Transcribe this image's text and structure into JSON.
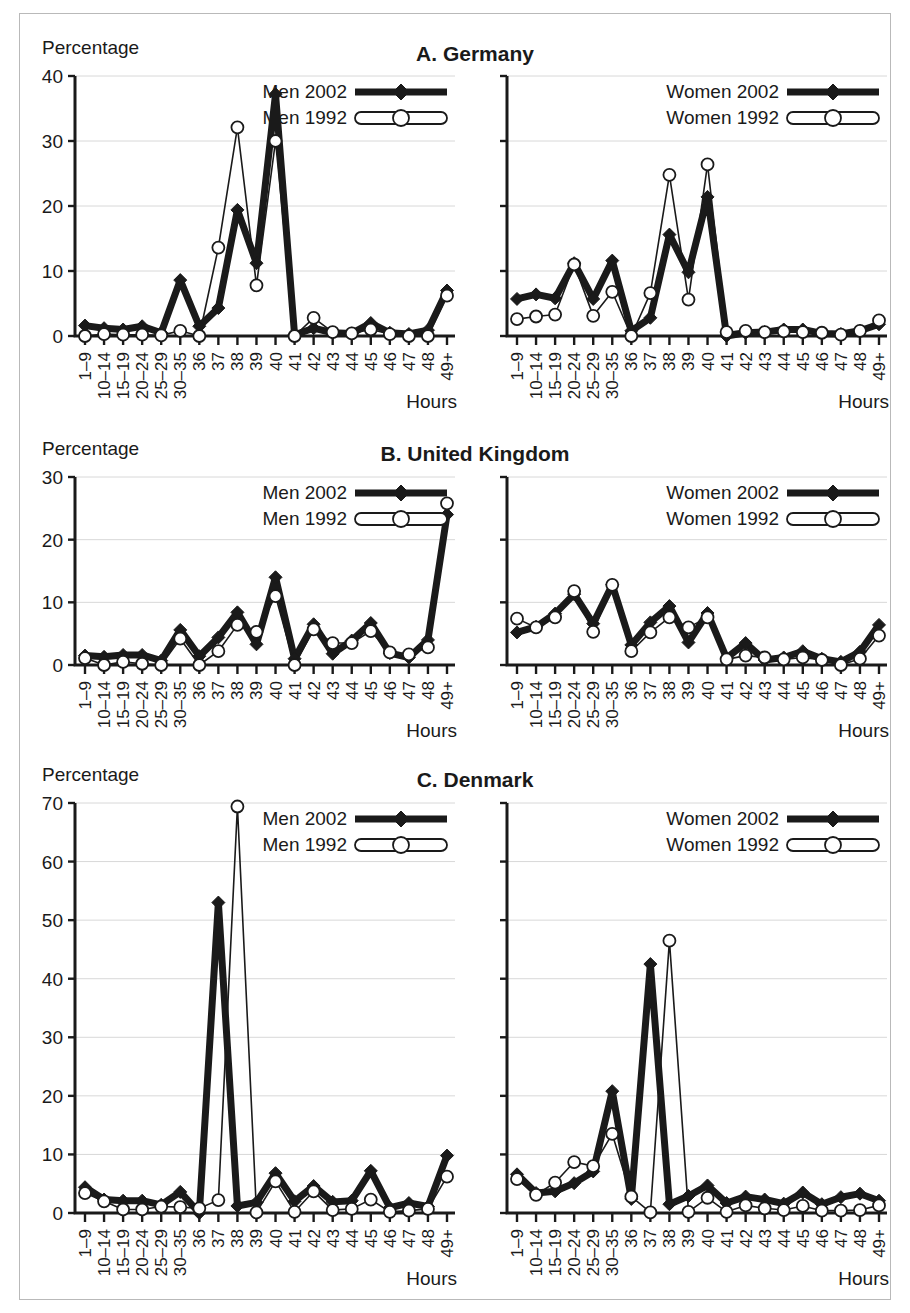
{
  "figure": {
    "y_axis_label": "Percentage",
    "x_axis_label": "Hours",
    "categories": [
      "1–9",
      "10–14",
      "15–19",
      "20–24",
      "25–29",
      "30–35",
      "36",
      "37",
      "38",
      "39",
      "40",
      "41",
      "42",
      "43",
      "44",
      "45",
      "46",
      "47",
      "48",
      "49+"
    ],
    "colors": {
      "ink": "#1a1a1a",
      "grid": "#d8d8d8",
      "frame": "#b9b9b9",
      "marker_fill_open": "#ffffff"
    }
  },
  "chart_data": [
    {
      "type": "line",
      "title": "A. Germany",
      "panel": "left",
      "subject": "men",
      "xlabel": "Hours",
      "ylabel": "Percentage",
      "ylim": [
        0,
        40
      ],
      "yticks": [
        0,
        10,
        20,
        30,
        40
      ],
      "grid": true,
      "legend_position": "top-right",
      "x": [
        "1–9",
        "10–14",
        "15–19",
        "20–24",
        "25–29",
        "30–35",
        "36",
        "37",
        "38",
        "39",
        "40",
        "41",
        "42",
        "43",
        "44",
        "45",
        "46",
        "47",
        "48",
        "49+"
      ],
      "series": [
        {
          "name": "Men 2002",
          "marker": "diamond-filled",
          "style": "thick-solid",
          "values": [
            1.6,
            1.2,
            1.0,
            1.5,
            0.5,
            8.6,
            1.5,
            4.3,
            19.4,
            11.2,
            37.2,
            0.2,
            1.2,
            0.5,
            0.4,
            2.0,
            0.5,
            0.3,
            0.9,
            7.0
          ]
        },
        {
          "name": "Men 1992",
          "marker": "circle-open",
          "style": "thin-open",
          "values": [
            0.0,
            0.3,
            0.2,
            0.2,
            0.1,
            0.8,
            0.0,
            13.6,
            32.1,
            7.8,
            30.0,
            0.0,
            2.8,
            0.6,
            0.4,
            1.0,
            0.3,
            0.0,
            0.0,
            6.2
          ]
        }
      ]
    },
    {
      "type": "line",
      "title": "A. Germany",
      "panel": "right",
      "subject": "women",
      "xlabel": "Hours",
      "ylabel": "Percentage",
      "ylim": [
        0,
        40
      ],
      "yticks": [
        0,
        10,
        20,
        30,
        40
      ],
      "grid": true,
      "legend_position": "top-right",
      "x": [
        "1–9",
        "10–14",
        "15–19",
        "20–24",
        "25–29",
        "30–35",
        "36",
        "37",
        "38",
        "39",
        "40",
        "41",
        "42",
        "43",
        "44",
        "45",
        "46",
        "47",
        "48",
        "49+"
      ],
      "series": [
        {
          "name": "Women 2002",
          "marker": "diamond-filled",
          "style": "thick-solid",
          "values": [
            5.7,
            6.4,
            5.8,
            11.2,
            5.7,
            11.6,
            0.8,
            2.8,
            15.6,
            9.8,
            21.4,
            0.0,
            0.5,
            0.6,
            1.0,
            1.0,
            0.4,
            0.3,
            0.8,
            1.8
          ]
        },
        {
          "name": "Women 1992",
          "marker": "circle-open",
          "style": "thin-open",
          "values": [
            2.6,
            3.0,
            3.3,
            11.0,
            3.1,
            6.8,
            0.0,
            6.6,
            24.8,
            5.6,
            26.4,
            0.6,
            0.8,
            0.6,
            0.7,
            0.6,
            0.5,
            0.2,
            0.8,
            2.4
          ]
        }
      ]
    },
    {
      "type": "line",
      "title": "B. United Kingdom",
      "panel": "left",
      "subject": "men",
      "xlabel": "Hours",
      "ylabel": "Percentage",
      "ylim": [
        0,
        30
      ],
      "yticks": [
        0,
        10,
        20,
        30
      ],
      "grid": true,
      "legend_position": "top-right",
      "x": [
        "1–9",
        "10–14",
        "15–19",
        "20–24",
        "25–29",
        "30–35",
        "36",
        "37",
        "38",
        "39",
        "40",
        "41",
        "42",
        "43",
        "44",
        "45",
        "46",
        "47",
        "48",
        "49+"
      ],
      "series": [
        {
          "name": "Men 2002",
          "marker": "diamond-filled",
          "style": "thick-solid",
          "values": [
            1.5,
            1.3,
            1.6,
            1.6,
            0.7,
            5.6,
            1.4,
            4.4,
            8.4,
            3.3,
            14.0,
            1.0,
            6.5,
            1.8,
            3.9,
            6.7,
            1.9,
            1.2,
            4.0,
            24.0
          ]
        },
        {
          "name": "Men 1992",
          "marker": "circle-open",
          "style": "thin-open",
          "values": [
            1.1,
            0.0,
            0.5,
            0.2,
            0.0,
            4.2,
            0.0,
            2.2,
            6.4,
            5.3,
            11.0,
            0.0,
            5.7,
            3.5,
            3.5,
            5.4,
            2.0,
            1.7,
            2.8,
            25.8
          ]
        }
      ]
    },
    {
      "type": "line",
      "title": "B. United Kingdom",
      "panel": "right",
      "subject": "women",
      "xlabel": "Hours",
      "ylabel": "Percentage",
      "ylim": [
        0,
        30
      ],
      "yticks": [
        0,
        10,
        20,
        30
      ],
      "grid": true,
      "legend_position": "top-right",
      "x": [
        "1–9",
        "10–14",
        "15–19",
        "20–24",
        "25–29",
        "30–35",
        "36",
        "37",
        "38",
        "39",
        "40",
        "41",
        "42",
        "43",
        "44",
        "45",
        "46",
        "47",
        "48",
        "49+"
      ],
      "series": [
        {
          "name": "Women 2002",
          "marker": "diamond-filled",
          "style": "thick-solid",
          "values": [
            5.2,
            6.1,
            8.2,
            11.3,
            6.6,
            12.8,
            3.2,
            6.8,
            9.4,
            3.6,
            8.3,
            1.1,
            3.5,
            0.8,
            1.2,
            2.2,
            1.0,
            0.5,
            2.1,
            6.4
          ]
        },
        {
          "name": "Women 1992",
          "marker": "circle-open",
          "style": "thin-open",
          "values": [
            7.4,
            6.0,
            7.6,
            11.8,
            5.3,
            12.8,
            2.2,
            5.2,
            7.6,
            6.0,
            7.6,
            0.9,
            1.5,
            1.2,
            0.9,
            1.2,
            0.8,
            0.0,
            1.0,
            4.7
          ]
        }
      ]
    },
    {
      "type": "line",
      "title": "C. Denmark",
      "panel": "left",
      "subject": "men",
      "xlabel": "Hours",
      "ylabel": "Percentage",
      "ylim": [
        0,
        70
      ],
      "yticks": [
        0,
        10,
        20,
        30,
        40,
        50,
        60,
        70
      ],
      "grid": true,
      "legend_position": "top-right",
      "x": [
        "1–9",
        "10–14",
        "15–19",
        "20–24",
        "25–29",
        "30–35",
        "36",
        "37",
        "38",
        "39",
        "40",
        "41",
        "42",
        "43",
        "44",
        "45",
        "46",
        "47",
        "48",
        "49+"
      ],
      "series": [
        {
          "name": "Men 2002",
          "marker": "diamond-filled",
          "style": "thick-solid",
          "values": [
            4.4,
            2.3,
            2.1,
            2.1,
            1.4,
            3.6,
            0.0,
            53.0,
            1.2,
            1.8,
            6.8,
            2.0,
            4.6,
            1.9,
            2.1,
            7.2,
            0.9,
            1.7,
            1.1,
            9.8
          ]
        },
        {
          "name": "Men 1992",
          "marker": "circle-open",
          "style": "thin-open",
          "values": [
            3.4,
            2.0,
            0.6,
            0.6,
            1.1,
            1.0,
            0.8,
            2.2,
            69.4,
            0.1,
            5.4,
            0.2,
            3.7,
            0.5,
            0.7,
            2.3,
            0.2,
            0.4,
            0.7,
            6.2
          ]
        }
      ]
    },
    {
      "type": "line",
      "title": "C. Denmark",
      "panel": "right",
      "subject": "women",
      "xlabel": "Hours",
      "ylabel": "Percentage",
      "ylim": [
        0,
        70
      ],
      "yticks": [
        0,
        10,
        20,
        30,
        40,
        50,
        60,
        70
      ],
      "grid": true,
      "legend_position": "top-right",
      "x": [
        "1–9",
        "10–14",
        "15–19",
        "20–24",
        "25–29",
        "30–35",
        "36",
        "37",
        "38",
        "39",
        "40",
        "41",
        "42",
        "43",
        "44",
        "45",
        "46",
        "47",
        "48",
        "49+"
      ],
      "series": [
        {
          "name": "Women 2002",
          "marker": "diamond-filled",
          "style": "thick-solid",
          "values": [
            6.6,
            3.4,
            3.7,
            5.1,
            7.1,
            20.8,
            2.4,
            42.5,
            1.5,
            2.9,
            4.7,
            1.7,
            2.8,
            2.3,
            1.6,
            3.5,
            1.5,
            2.7,
            3.3,
            2.1
          ]
        },
        {
          "name": "Women 1992",
          "marker": "circle-open",
          "style": "thin-open",
          "values": [
            5.8,
            3.1,
            5.2,
            8.7,
            8.0,
            13.5,
            2.8,
            0.1,
            46.5,
            0.2,
            2.6,
            0.2,
            1.3,
            0.8,
            0.5,
            1.2,
            0.4,
            0.4,
            0.5,
            1.3
          ]
        }
      ]
    }
  ],
  "rows": [
    {
      "id": "A",
      "title": "A. Germany",
      "left_legend": [
        "Men 2002",
        "Men 1992"
      ],
      "right_legend": [
        "Women 2002",
        "Women 1992"
      ]
    },
    {
      "id": "B",
      "title": "B. United Kingdom",
      "left_legend": [
        "Men 2002",
        "Men 1992"
      ],
      "right_legend": [
        "Women 2002",
        "Women 1992"
      ]
    },
    {
      "id": "C",
      "title": "C. Denmark",
      "left_legend": [
        "Men 2002",
        "Men 1992"
      ],
      "right_legend": [
        "Women 2002",
        "Women 1992"
      ]
    }
  ]
}
